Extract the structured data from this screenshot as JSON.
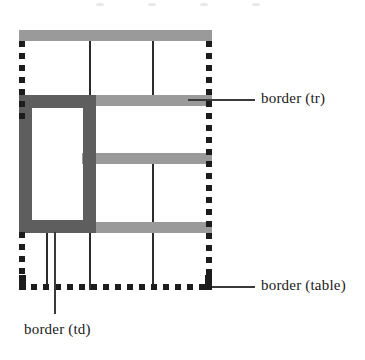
{
  "diagram": {
    "type": "table-border-diagram",
    "colors": {
      "table_border": "#1c1c1c",
      "tr_border": "#9a9a9a",
      "td_border": "#5e5e5e",
      "cell_rule": "#2b2b2b",
      "leader_line": "#3a3a3a",
      "background": "#ffffff"
    },
    "labels": [
      {
        "id": "tr",
        "text": "border (tr)"
      },
      {
        "id": "table",
        "text": "border (table)"
      },
      {
        "id": "td",
        "text": "border (td)"
      }
    ],
    "table": {
      "columns": 3,
      "rows": 3,
      "outer_border_style": "dashed",
      "tr_border_style": "solid-thick-gray",
      "td_border_style": "solid-thick-darkgray"
    }
  }
}
